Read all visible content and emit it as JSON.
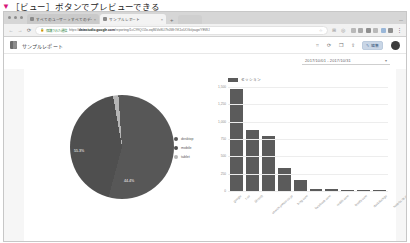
{
  "caption": {
    "bullet": "▼",
    "text": "［ビュー］ボタンでプレビューできる"
  },
  "browser": {
    "tabs": [
      {
        "title": "すべてのユーザー > すべてのデータ",
        "active": false,
        "close": "×"
      },
      {
        "title": "サンプルレポート",
        "active": true,
        "close": "×"
      }
    ],
    "new_tab": "+",
    "window_controls": {
      "minimize": "—",
      "maximize": "□",
      "close": "×"
    },
    "nav": {
      "back": "←",
      "forward": "→",
      "reload": "⟳"
    },
    "omnibox": {
      "lock": "🔒",
      "secure_label": "保護された通信",
      "url_prefix": "https://",
      "url_domain": "datastudio.google.com",
      "url_path": "/reporting/1cC99QO2o-eq86VoSLl7h0Wr7iK1xUO/kt/page/YEWJ",
      "star": "☆",
      "extension_badge": "⊞",
      "profile": "◎"
    },
    "toolbar_extensions": [
      "ext-1",
      "ext-2",
      "ext-3",
      "ext-4",
      "ext-5",
      "ext-6"
    ],
    "menu": "⋮"
  },
  "app": {
    "logo": "data-studio-logo",
    "title": "サンプルレポート",
    "actions": [
      {
        "name": "reset-icon",
        "glyph": "⌗"
      },
      {
        "name": "refresh-icon",
        "glyph": "⟳"
      },
      {
        "name": "copy-icon",
        "glyph": "❐"
      },
      {
        "name": "share-icon",
        "glyph": "⇪"
      }
    ],
    "edit_button": {
      "icon": "✎",
      "label": "編集"
    },
    "avatar": "user-avatar"
  },
  "date_range": {
    "value": "2017/10/01 - 2017/10/31",
    "caret": "▾"
  },
  "chart_data": [
    {
      "type": "pie",
      "title": "",
      "labels": [
        "desktop",
        "mobile",
        "tablet"
      ],
      "values": [
        55.3,
        44.4,
        1.3
      ],
      "value_labels": [
        "55.3%",
        "44.4%",
        ""
      ],
      "colors": [
        "#575757",
        "#4f4f4f",
        "#b5b5b5"
      ],
      "legend_position": "right"
    },
    {
      "type": "bar",
      "title": "",
      "legend": [
        "セッション"
      ],
      "categories": [
        "google",
        "t.co",
        "(direct)",
        "search.yahoo.co.jp",
        "bing.com",
        "facebook.com",
        "reddit.com",
        "feedly.com",
        "duckduckgo",
        "hatena.ne.jp"
      ],
      "values": [
        1470,
        880,
        800,
        330,
        165,
        30,
        22,
        18,
        14,
        10
      ],
      "ylim": [
        0,
        1500
      ],
      "yticks": [
        "1,500",
        "1,250",
        "1,000",
        "750",
        "500",
        "250",
        "0"
      ],
      "ylabel": "",
      "xlabel": "",
      "grid": true,
      "color": "#5b5b5b"
    }
  ]
}
